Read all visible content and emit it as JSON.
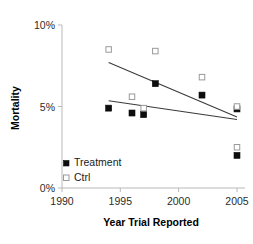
{
  "chart_data": {
    "type": "scatter",
    "title": "",
    "xlabel": "Year Trial Reported",
    "ylabel": "Mortality",
    "xlim": [
      1990,
      2005
    ],
    "ylim": [
      0,
      10
    ],
    "xticks": [
      1990,
      1995,
      2000,
      2005
    ],
    "xtick_labels": [
      "1990",
      "1995",
      "2000",
      "2005"
    ],
    "yticks": [
      0,
      5,
      10
    ],
    "ytick_labels": [
      "0%",
      "5%",
      "10%"
    ],
    "grid": false,
    "legend_position": "lower-left-inside",
    "series": [
      {
        "name": "Treatment",
        "marker": "filled-square",
        "color": "#0d0d0d",
        "points": [
          {
            "x": 1994,
            "y": 4.9
          },
          {
            "x": 1996,
            "y": 4.6
          },
          {
            "x": 1997,
            "y": 4.5
          },
          {
            "x": 1998,
            "y": 6.4
          },
          {
            "x": 2002,
            "y": 5.7
          },
          {
            "x": 2005,
            "y": 4.85
          },
          {
            "x": 2005,
            "y": 2.0
          }
        ],
        "trendline": {
          "x1": 1994,
          "y1": 7.7,
          "x2": 2005,
          "y2": 4.35
        }
      },
      {
        "name": "Ctrl",
        "marker": "open-square",
        "color": "#9a9a9a",
        "points": [
          {
            "x": 1994,
            "y": 8.5
          },
          {
            "x": 1996,
            "y": 5.6
          },
          {
            "x": 1997,
            "y": 4.9
          },
          {
            "x": 1998,
            "y": 8.4
          },
          {
            "x": 2002,
            "y": 6.8
          },
          {
            "x": 2005,
            "y": 5.0
          },
          {
            "x": 2005,
            "y": 2.5
          }
        ],
        "trendline": {
          "x1": 1994,
          "y1": 5.35,
          "x2": 2005,
          "y2": 4.2
        }
      }
    ]
  },
  "legend": {
    "items": [
      {
        "label": "Treatment",
        "marker": "filled-square"
      },
      {
        "label": "Ctrl",
        "marker": "open-square"
      }
    ]
  },
  "axes": {
    "x_title": "Year Trial Reported",
    "y_title": "Mortality",
    "x_tick_labels": [
      "1990",
      "1995",
      "2000",
      "2005"
    ],
    "y_tick_labels": [
      "10%",
      "5%",
      "0%"
    ]
  }
}
